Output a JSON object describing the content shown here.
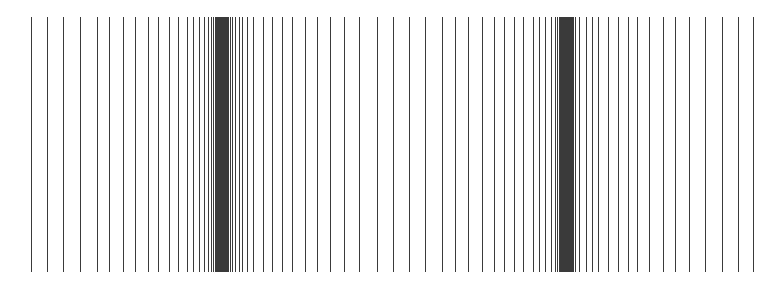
{
  "pattern": {
    "description": "Vertical line pattern with two dense clusters",
    "line_color": "#3a3a3a",
    "background": "#ffffff",
    "line_top": 17,
    "line_bottom": 272,
    "x_positions": [
      31,
      47,
      63,
      80,
      97,
      109,
      123,
      135,
      148,
      158,
      169,
      178,
      187,
      193,
      199,
      204,
      208,
      211,
      213,
      215,
      216,
      217,
      218,
      219,
      220,
      221,
      222,
      223,
      224,
      225,
      226,
      227,
      228,
      230,
      232,
      235,
      239,
      242,
      247,
      253,
      263,
      272,
      282,
      292,
      305,
      317,
      330,
      344,
      359,
      377,
      393,
      409,
      425,
      442,
      455,
      468,
      482,
      494,
      504,
      514,
      523,
      533,
      539,
      545,
      551,
      555,
      557,
      559,
      560,
      561,
      562,
      563,
      564,
      565,
      566,
      567,
      568,
      569,
      570,
      571,
      572,
      573,
      575,
      579,
      586,
      592,
      598,
      608,
      618,
      628,
      637,
      649,
      663,
      675,
      689,
      705,
      722,
      738,
      753
    ]
  }
}
